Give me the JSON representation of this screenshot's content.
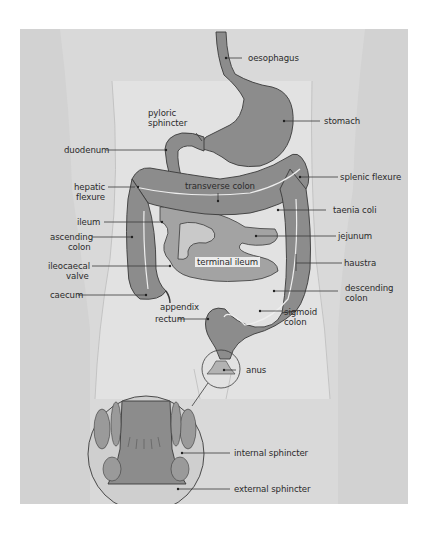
{
  "diagram": {
    "colors": {
      "background": "#ffffff",
      "panel": "#d9d9d9",
      "body_silhouette": "#e4e4e4",
      "organ_fill": "#8c8c8c",
      "small_intestine_fill": "#a3a3a3",
      "outline": "#3a3a3a",
      "taenia_line": "#eeeeee",
      "leader_line": "#3a3a3a",
      "label_text": "#2b2b2b"
    },
    "labels": {
      "oesophagus": "oesophagus",
      "pyloric_sphincter_1": "pyloric",
      "pyloric_sphincter_2": "sphincter",
      "stomach": "stomach",
      "duodenum": "duodenum",
      "transverse_colon": "transverse colon",
      "hepatic_flexure_1": "hepatic",
      "hepatic_flexure_2": "flexure",
      "splenic_flexure": "splenic flexure",
      "taenia_coli": "taenia  coli",
      "ileum": "ileum",
      "ascending_colon_1": "ascending",
      "ascending_colon_2": "colon",
      "jejunum": "jejunum",
      "terminal_ileum": "terminal ileum",
      "ileocaecal_valve_1": "ileocaecal",
      "ileocaecal_valve_2": "valve",
      "haustra": "haustra",
      "caecum": "caecum",
      "descending_colon_1": "descending",
      "descending_colon_2": "colon",
      "appendix": "appendix",
      "rectum": "rectum",
      "sigmoid_colon_1": "sigmoid",
      "sigmoid_colon_2": "colon",
      "anus": "anus",
      "internal_sphincter": "internal sphincter",
      "external_sphincter": "external sphincter"
    }
  }
}
